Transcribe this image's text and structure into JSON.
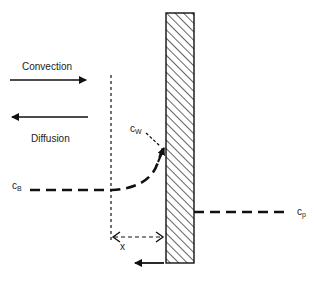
{
  "diagram": {
    "labels": {
      "convection": "Convection",
      "diffusion": "Diffusion",
      "c_w": {
        "base": "c",
        "sub": "W"
      },
      "c_b": {
        "base": "c",
        "sub": "B"
      },
      "c_p": {
        "base": "c",
        "sub": "p"
      },
      "x": "x"
    },
    "colors": {
      "line": "#111111",
      "wall_fill": "#ffffff",
      "hatch": "#222222"
    },
    "elements": [
      "convection-arrow (right)",
      "diffusion-arrow (left)",
      "boundary-layer dotted line",
      "membrane wall (hatched)",
      "concentration profile (dashed curve)",
      "permeate concentration line (dashed)",
      "boundary layer thickness x (double arrow)",
      "flux arrow below wall (left)"
    ]
  }
}
